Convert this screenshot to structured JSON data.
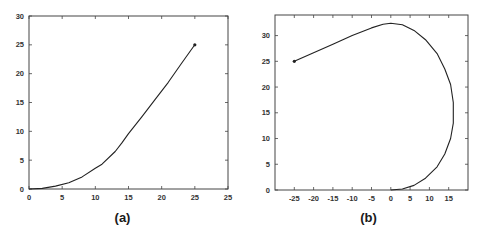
{
  "chart_data": [
    {
      "id": "a",
      "type": "line",
      "title": "",
      "caption": "(a)",
      "xlabel": "",
      "ylabel": "",
      "xlim": [
        0,
        30
      ],
      "ylim": [
        0,
        30
      ],
      "grid": false,
      "legend": null,
      "x_ticks": [
        0,
        5,
        10,
        15,
        20,
        25,
        30
      ],
      "x_tick_labels": [
        "0",
        "5",
        "10",
        "15",
        "20",
        "25",
        "25"
      ],
      "y_ticks": [
        0,
        5,
        10,
        15,
        20,
        25,
        30
      ],
      "y_tick_labels": [
        "0",
        "5",
        "10",
        "15",
        "20",
        "25",
        "30"
      ],
      "series": [
        {
          "name": "trajectory",
          "x": [
            0,
            2,
            4,
            6,
            8,
            10,
            11,
            13,
            14,
            15,
            17,
            19,
            21,
            23,
            25
          ],
          "y": [
            0,
            0.1,
            0.5,
            1.1,
            2.1,
            3.6,
            4.3,
            6.5,
            8,
            9.6,
            12.5,
            15.5,
            18.5,
            21.8,
            25
          ],
          "end_marker": [
            25,
            25
          ]
        }
      ]
    },
    {
      "id": "b",
      "type": "line",
      "title": "",
      "caption": "(b)",
      "xlabel": "",
      "ylabel": "",
      "xlim": [
        -30,
        20
      ],
      "ylim": [
        0,
        34
      ],
      "grid": false,
      "legend": null,
      "x_ticks": [
        -25,
        -20,
        -15,
        -10,
        -5,
        0,
        5,
        10,
        15
      ],
      "x_tick_labels": [
        "-25",
        "-20",
        "-15",
        "-10",
        "-5",
        "0",
        "5",
        "10",
        "15"
      ],
      "y_ticks": [
        0,
        5,
        10,
        15,
        20,
        25,
        30
      ],
      "y_tick_labels": [
        "0",
        "5",
        "10",
        "15",
        "20",
        "25",
        "30"
      ],
      "series": [
        {
          "name": "trajectory",
          "x": [
            -25,
            -15,
            -10,
            -5,
            -2,
            0,
            3,
            6,
            9,
            12,
            14,
            15.5,
            16.2,
            16.2,
            15.5,
            14,
            12,
            9,
            6,
            3,
            0
          ],
          "y": [
            25,
            28.3,
            30,
            31.5,
            32.2,
            32.4,
            32.1,
            31,
            29.2,
            26.5,
            23.5,
            20.5,
            17,
            13,
            10,
            7,
            4.5,
            2.3,
            0.9,
            0.2,
            0
          ],
          "start_marker": [
            -25,
            25
          ]
        }
      ]
    }
  ],
  "colors": {
    "line": "#222222",
    "axis": "#444444",
    "text": "#333333",
    "background": "#ffffff"
  },
  "layout": {
    "panels": [
      {
        "left": 29,
        "top": 16,
        "right": 228,
        "bottom": 189
      },
      {
        "left": 275,
        "top": 15,
        "right": 468,
        "bottom": 190
      }
    ]
  }
}
